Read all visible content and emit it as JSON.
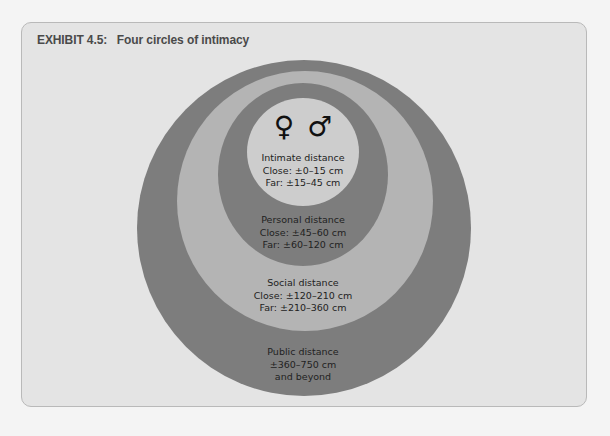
{
  "exhibit": {
    "title": "EXHIBIT 4.5:   Four circles of intimacy"
  },
  "colors": {
    "page_bg": "#f4f4f4",
    "panel_bg": "#e4e4e4",
    "public_ring": "#7d7d7d",
    "social_ring": "#b4b4b4",
    "personal_ring": "#7d7d7d",
    "intimate_core": "#cdcdcd"
  },
  "symbols": {
    "female": "♀",
    "male": "♂"
  },
  "zones": [
    {
      "id": "intimate",
      "name": "Intimate distance",
      "lines": [
        "Close: ±0–15 cm",
        "Far: ±15–45 cm"
      ]
    },
    {
      "id": "personal",
      "name": "Personal distance",
      "lines": [
        "Close: ±45–60 cm",
        "Far: ±60–120 cm"
      ]
    },
    {
      "id": "social",
      "name": "Social distance",
      "lines": [
        "Close: ±120–210 cm",
        "Far: ±210–360 cm"
      ]
    },
    {
      "id": "public",
      "name": "Public distance",
      "lines": [
        "±360–750 cm",
        "and beyond"
      ]
    }
  ]
}
